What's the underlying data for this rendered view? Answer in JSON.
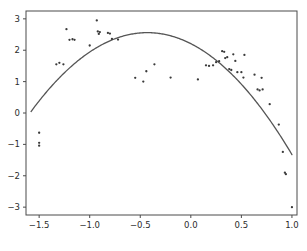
{
  "chart_data": {
    "type": "scatter",
    "title": "",
    "subtitle": "",
    "xlabel": "",
    "ylabel": "",
    "xlim": [
      -1.63,
      1.05
    ],
    "ylim": [
      -3.25,
      3.25
    ],
    "grid": false,
    "legend": null,
    "xticks": [
      -1.5,
      -1.0,
      -0.5,
      0.0,
      0.5,
      1.0
    ],
    "xticklabels": [
      "−1.5",
      "−1.0",
      "−0.5",
      "0.0",
      "0.5",
      "1.0"
    ],
    "yticks": [
      3,
      2,
      1,
      0,
      -1,
      -2,
      -3
    ],
    "yticklabels": [
      "3",
      "2",
      "1",
      "0",
      "−1",
      "−2",
      "−3"
    ],
    "marker_color": "#3a3a3a",
    "curve_color": "#555555",
    "axis_color": "#4a4a4a",
    "background_color": "#ffffff",
    "series": [
      {
        "name": "observations",
        "type": "scatter",
        "marker": "point",
        "points": [
          [
            -1.5,
            -0.63
          ],
          [
            -1.5,
            -0.95
          ],
          [
            -1.5,
            -1.04
          ],
          [
            -1.33,
            1.55
          ],
          [
            -1.3,
            1.6
          ],
          [
            -1.26,
            1.55
          ],
          [
            -1.23,
            2.67
          ],
          [
            -1.2,
            2.33
          ],
          [
            -1.17,
            2.35
          ],
          [
            -1.15,
            2.33
          ],
          [
            -1.0,
            2.15
          ],
          [
            -0.93,
            2.95
          ],
          [
            -0.92,
            2.6
          ],
          [
            -0.91,
            2.52
          ],
          [
            -0.9,
            2.58
          ],
          [
            -0.82,
            2.55
          ],
          [
            -0.8,
            2.53
          ],
          [
            -0.78,
            2.36
          ],
          [
            -0.72,
            2.34
          ],
          [
            -0.55,
            1.12
          ],
          [
            -0.47,
            1.0
          ],
          [
            -0.44,
            1.33
          ],
          [
            -0.36,
            1.55
          ],
          [
            -0.2,
            1.13
          ],
          [
            0.07,
            1.07
          ],
          [
            0.15,
            1.52
          ],
          [
            0.18,
            1.5
          ],
          [
            0.22,
            1.52
          ],
          [
            0.25,
            1.62
          ],
          [
            0.28,
            1.65
          ],
          [
            0.31,
            1.97
          ],
          [
            0.33,
            1.95
          ],
          [
            0.34,
            1.75
          ],
          [
            0.36,
            1.78
          ],
          [
            0.38,
            1.4
          ],
          [
            0.4,
            1.37
          ],
          [
            0.42,
            1.87
          ],
          [
            0.44,
            1.66
          ],
          [
            0.46,
            1.3
          ],
          [
            0.5,
            1.3
          ],
          [
            0.52,
            1.13
          ],
          [
            0.53,
            1.85
          ],
          [
            0.63,
            1.22
          ],
          [
            0.66,
            0.75
          ],
          [
            0.68,
            0.72
          ],
          [
            0.7,
            1.12
          ],
          [
            0.71,
            0.75
          ],
          [
            0.78,
            0.28
          ],
          [
            0.87,
            -0.37
          ],
          [
            0.91,
            -1.24
          ],
          [
            0.93,
            -1.9
          ],
          [
            0.94,
            -1.95
          ],
          [
            1.0,
            -3.0
          ]
        ]
      },
      {
        "name": "quadratic-fit",
        "type": "line",
        "equation": "y = -1.90 (x + 0.43)^2 + 2.56",
        "vertex": [
          -0.43,
          2.56
        ],
        "a": -1.9,
        "x_range": [
          -1.58,
          1.0
        ],
        "endpoints": [
          [
            -1.58,
            0.1
          ],
          [
            1.0,
            -1.4
          ]
        ]
      }
    ]
  },
  "axes": {
    "frame": {
      "left_px": 26,
      "right_px": 297,
      "top_px": 11,
      "bottom_px": 215
    }
  }
}
